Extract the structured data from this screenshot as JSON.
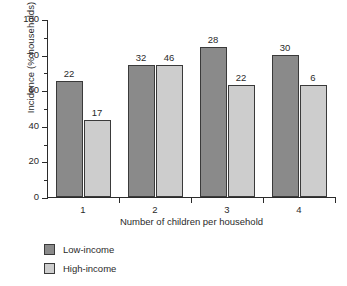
{
  "chart_data": {
    "type": "bar",
    "title": "",
    "xlabel": "Number of children per household",
    "ylabel": "Incidence (% households)",
    "categories": [
      "1",
      "2",
      "3",
      "4"
    ],
    "ylim": [
      0,
      100
    ],
    "yticks": [
      0,
      20,
      40,
      60,
      80,
      100
    ],
    "ytick_labels": [
      "0",
      "20",
      "40",
      "60",
      "80",
      "100"
    ],
    "grid": false,
    "legend_position": "below-left",
    "series": [
      {
        "name": "Low-income",
        "color": "#8a8a8a",
        "values": [
          65,
          74,
          84,
          80
        ],
        "point_labels": [
          "22",
          "32",
          "28",
          "30"
        ]
      },
      {
        "name": "High-income",
        "color": "#cdcdcd",
        "values": [
          43,
          74,
          63,
          63
        ],
        "point_labels": [
          "17",
          "46",
          "22",
          "6"
        ]
      }
    ]
  },
  "colors": {
    "low_income": "#8a8a8a",
    "high_income": "#cdcdcd",
    "axis": "#2b2b2b",
    "text": "#2a2a2a",
    "background": "#ffffff"
  }
}
